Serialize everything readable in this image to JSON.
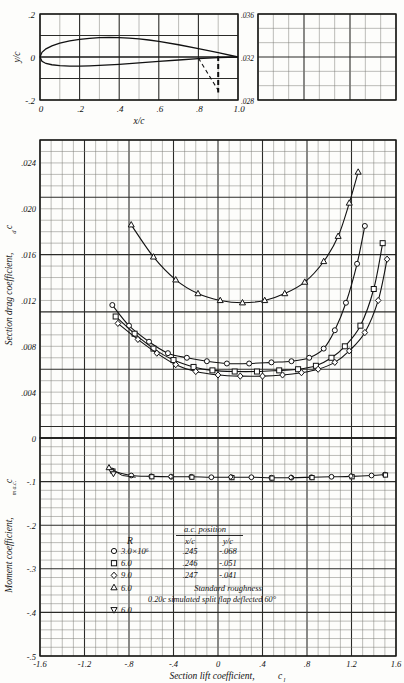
{
  "figure": {
    "kind": "naca-airfoil-section-data",
    "panels": [
      "airfoil-profile",
      "drag-polar",
      "moment-coefficient",
      "auxiliary-grid"
    ]
  },
  "profile_panel": {
    "ylabel": "y/c",
    "xlabel": "x/c",
    "y_ticks": [
      ".2",
      "0",
      "-.2"
    ],
    "y_values": [
      0.2,
      0,
      -0.2
    ],
    "x_ticks": [
      "0",
      ".2",
      ".4",
      ".6",
      ".8",
      "1.0"
    ],
    "x_values": [
      0,
      0.2,
      0.4,
      0.6,
      0.8,
      1.0
    ],
    "flap_hinge_x": 0.8,
    "flap_line_x": 0.9
  },
  "aux_panel": {
    "y_ticks": [
      ".036",
      ".032",
      ".028"
    ],
    "y_values": [
      0.036,
      0.032,
      0.028
    ]
  },
  "drag_panel": {
    "ylabel": "Section drag coefficient,",
    "ylabel_sub": "c",
    "ylabel_subsub": "d",
    "y_ticks": [
      "0",
      ".004",
      ".008",
      ".012",
      ".016",
      ".020",
      ".024"
    ],
    "y_values": [
      0,
      0.004,
      0.008,
      0.012,
      0.016,
      0.02,
      0.024
    ],
    "ylim": [
      0,
      0.026
    ]
  },
  "moment_panel": {
    "ylabel": "Moment coefficient,",
    "ylabel_sub": "c",
    "ylabel_subsub": "m a.c.",
    "y_ticks": [
      "-.1",
      "-.2",
      "-.3",
      "-.4",
      "-.5"
    ],
    "y_values": [
      -0.1,
      -0.2,
      -0.3,
      -0.4,
      -0.5
    ],
    "ylim": [
      -0.5,
      0
    ]
  },
  "x_axis": {
    "label": "Section lift coefficient,",
    "label_sub": "c",
    "label_subsub": "l",
    "ticks": [
      "-1.6",
      "-1.2",
      "-.8",
      "-.4",
      "0",
      ".4",
      ".8",
      "1.2",
      "1.6"
    ],
    "values": [
      -1.6,
      -1.2,
      -0.8,
      -0.4,
      0,
      0.4,
      0.8,
      1.2,
      1.6
    ],
    "xlim": [
      -1.6,
      1.6
    ]
  },
  "legend": {
    "title_ac": "a.c. position",
    "col_R": "R",
    "col_xc": "x/c",
    "col_yc": "y/c",
    "rows": [
      {
        "symbol": "circle",
        "R": "3.0×10⁶",
        "xc": ".245",
        "yc": "-.068"
      },
      {
        "symbol": "square",
        "R": "6.0",
        "xc": ".246",
        "yc": "-.051"
      },
      {
        "symbol": "diamond",
        "R": "9.0",
        "xc": ".247",
        "yc": "-.041"
      },
      {
        "symbol": "triangle",
        "R": "6.0",
        "xc": "",
        "yc": "",
        "note": "Standard roughness"
      },
      {
        "symbol": "dtriangle",
        "R": "6.0",
        "xc": "",
        "yc": "",
        "note": ""
      }
    ],
    "flap_note": "0.20c simulated split flap deflected 60°"
  },
  "chart_data": {
    "type": "line",
    "title": "",
    "xlabel": "Section lift coefficient, c_l",
    "ylabel": "Section drag coefficient, c_d",
    "xlim": [
      -1.6,
      1.6
    ],
    "ylim": [
      0,
      0.026
    ],
    "grid": true,
    "legend_position": "inside-lower-left",
    "series": [
      {
        "name": "R = 3.0×10⁶",
        "symbol": "circle",
        "panel": "drag",
        "x": [
          -0.95,
          -0.8,
          -0.62,
          -0.45,
          -0.28,
          -0.1,
          0.08,
          0.28,
          0.48,
          0.66,
          0.82,
          0.95,
          1.05,
          1.15,
          1.25,
          1.32
        ],
        "y": [
          0.0116,
          0.0098,
          0.0084,
          0.0074,
          0.007,
          0.0067,
          0.0065,
          0.0065,
          0.0066,
          0.0067,
          0.007,
          0.0078,
          0.0094,
          0.0118,
          0.0152,
          0.0185
        ]
      },
      {
        "name": "R = 6.0×10⁶",
        "symbol": "square",
        "panel": "drag",
        "x": [
          -0.92,
          -0.75,
          -0.58,
          -0.4,
          -0.22,
          -0.05,
          0.15,
          0.35,
          0.55,
          0.72,
          0.88,
          1.02,
          1.14,
          1.28,
          1.4,
          1.48
        ],
        "y": [
          0.0106,
          0.0091,
          0.0078,
          0.0068,
          0.0062,
          0.0059,
          0.0058,
          0.0058,
          0.0059,
          0.006,
          0.0063,
          0.007,
          0.008,
          0.0098,
          0.013,
          0.017
        ]
      },
      {
        "name": "R = 9.0×10⁶",
        "symbol": "diamond",
        "panel": "drag",
        "x": [
          -0.9,
          -0.72,
          -0.55,
          -0.38,
          -0.2,
          0.0,
          0.2,
          0.4,
          0.58,
          0.75,
          0.9,
          1.05,
          1.18,
          1.32,
          1.44,
          1.52
        ],
        "y": [
          0.01,
          0.0086,
          0.0074,
          0.0064,
          0.0058,
          0.0055,
          0.0054,
          0.0054,
          0.0055,
          0.0057,
          0.006,
          0.0066,
          0.0076,
          0.0092,
          0.012,
          0.0156
        ]
      },
      {
        "name": "R = 6.0×10⁶ standard roughness",
        "symbol": "triangle",
        "panel": "drag",
        "x": [
          -0.78,
          -0.58,
          -0.38,
          -0.18,
          0.02,
          0.22,
          0.42,
          0.6,
          0.78,
          0.95,
          1.08,
          1.18,
          1.26
        ],
        "y": [
          0.0186,
          0.0158,
          0.0138,
          0.0126,
          0.012,
          0.0118,
          0.012,
          0.0126,
          0.0136,
          0.0154,
          0.0176,
          0.0205,
          0.0232
        ]
      }
    ],
    "moment_series": [
      {
        "name": "c_m a.c.",
        "symbol": "circle",
        "panel": "moment",
        "x": [
          -0.95,
          -0.78,
          -0.6,
          -0.42,
          -0.24,
          -0.06,
          0.12,
          0.3,
          0.48,
          0.66,
          0.84,
          1.02,
          1.2,
          1.38,
          1.5
        ],
        "y": [
          -0.075,
          -0.086,
          -0.088,
          -0.089,
          -0.089,
          -0.09,
          -0.09,
          -0.09,
          -0.091,
          -0.091,
          -0.09,
          -0.089,
          -0.088,
          -0.086,
          -0.084
        ]
      }
    ],
    "profile_curve": {
      "name": "airfoil-section-profile",
      "x_upper": [
        0,
        0.01,
        0.03,
        0.06,
        0.1,
        0.15,
        0.2,
        0.25,
        0.3,
        0.35,
        0.4,
        0.45,
        0.5,
        0.55,
        0.6,
        0.7,
        0.8,
        0.9,
        1.0
      ],
      "y_upper": [
        0,
        0.022,
        0.038,
        0.052,
        0.064,
        0.075,
        0.082,
        0.087,
        0.09,
        0.091,
        0.09,
        0.088,
        0.084,
        0.079,
        0.073,
        0.057,
        0.039,
        0.02,
        0.0
      ],
      "x_lower": [
        0,
        0.01,
        0.03,
        0.06,
        0.1,
        0.15,
        0.2,
        0.25,
        0.3,
        0.4,
        0.5,
        0.6,
        0.7,
        0.8,
        0.9,
        1.0
      ],
      "y_lower": [
        0,
        -0.02,
        -0.03,
        -0.036,
        -0.04,
        -0.042,
        -0.042,
        -0.041,
        -0.039,
        -0.034,
        -0.027,
        -0.02,
        -0.014,
        -0.008,
        -0.003,
        0.0
      ]
    }
  }
}
